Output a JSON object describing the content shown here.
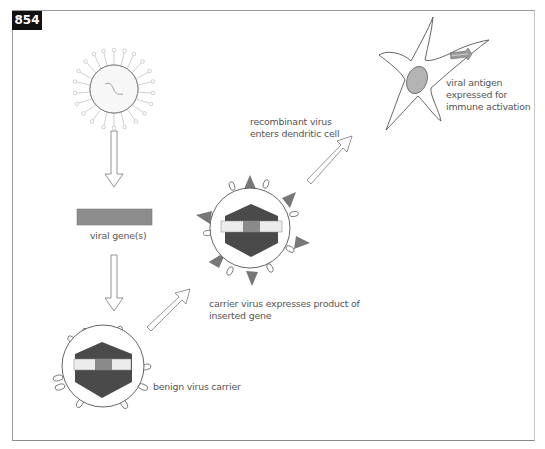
{
  "figure": {
    "number": "854"
  },
  "labels": {
    "viral_genes": "viral gene(s)",
    "benign_carrier": "benign virus carrier",
    "carrier_expresses_line1": "carrier virus expresses product of",
    "carrier_expresses_line2": "inserted gene",
    "recombinant_enters_line1": "recombinant virus",
    "recombinant_enters_line2": "enters dendritic cell",
    "antigen_line1": "viral antigen",
    "antigen_line2": "expressed for",
    "antigen_line3": "immune activation"
  },
  "colors": {
    "dark_capsid": "#4a4a4a",
    "gene_bar": "#8c8c8c",
    "insert_light": "#ececec",
    "insert_mid": "#8a8a8a",
    "spike_triangle": "#777777",
    "nucleus": "#b4b4b4",
    "outline": "#555555",
    "text": "#555555"
  }
}
